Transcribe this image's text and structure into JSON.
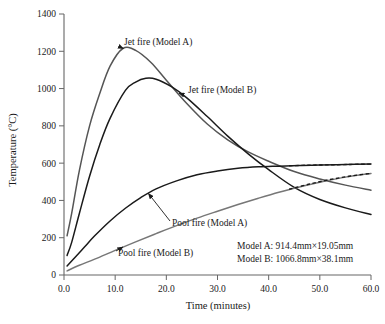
{
  "chart_data": {
    "type": "line",
    "title": "",
    "xlabel": "Time (minutes)",
    "ylabel": "Temperature (°C)",
    "xlim": [
      0,
      60
    ],
    "ylim": [
      0,
      1400
    ],
    "xticks": [
      "0.0",
      "10.0",
      "20.0",
      "30.0",
      "40.0",
      "50.0",
      "60.0"
    ],
    "yticks": [
      "0",
      "200",
      "400",
      "600",
      "800",
      "1000",
      "1200",
      "1400"
    ],
    "grid": false,
    "legend_position": "inline-annotations",
    "series": [
      {
        "name": "Jet fire (Model A)",
        "color": "#555555",
        "style": "solid",
        "x": [
          0.6,
          1.5,
          3,
          5,
          7,
          9,
          11.5,
          14,
          17,
          20,
          24,
          28,
          32,
          36,
          40,
          45,
          50,
          55,
          60
        ],
        "values": [
          210,
          330,
          560,
          800,
          975,
          1120,
          1215,
          1205,
          1140,
          1045,
          920,
          810,
          725,
          660,
          610,
          555,
          515,
          482,
          455
        ]
      },
      {
        "name": "Jet fire (Model B)",
        "color": "#1a1a1a",
        "style": "solid",
        "x": [
          0.6,
          1.5,
          3,
          5,
          7,
          9,
          12,
          14,
          16,
          18,
          21,
          24,
          28,
          32,
          36,
          40,
          45,
          50,
          55,
          60
        ],
        "values": [
          105,
          175,
          330,
          530,
          700,
          840,
          990,
          1035,
          1055,
          1050,
          1010,
          950,
          850,
          745,
          650,
          565,
          470,
          405,
          360,
          325
        ]
      },
      {
        "name": "Pool fire (Model A)",
        "color": "#1a1a1a",
        "style": "solid",
        "x": [
          0.6,
          2,
          4,
          6,
          9,
          12,
          15,
          18,
          22,
          26,
          30,
          34,
          38,
          42,
          46,
          50,
          55,
          60
        ],
        "values": [
          48,
          90,
          150,
          210,
          290,
          358,
          415,
          462,
          505,
          538,
          558,
          572,
          580,
          584,
          588,
          590,
          593,
          595
        ]
      },
      {
        "name": "Pool fire (Model B)",
        "color": "#777777",
        "style": "solid",
        "x": [
          0.6,
          3,
          6,
          10,
          14,
          18,
          22,
          26,
          30,
          34,
          38,
          42,
          46,
          50,
          55,
          60
        ],
        "values": [
          22,
          52,
          85,
          132,
          178,
          222,
          265,
          305,
          342,
          378,
          412,
          444,
          472,
          498,
          525,
          545
        ]
      }
    ],
    "dashed_extensions": [
      {
        "name": "Pool fire (Model A) extrapolation",
        "color": "#1a1a1a",
        "style": "dashed",
        "x": [
          44,
          48,
          52,
          56,
          60
        ],
        "values": [
          586,
          589,
          591,
          593,
          595
        ]
      },
      {
        "name": "Pool fire (Model B) extrapolation",
        "color": "#1a1a1a",
        "style": "dashed",
        "x": [
          44,
          48,
          52,
          56,
          60
        ],
        "values": [
          460,
          488,
          512,
          531,
          545
        ]
      }
    ],
    "annotations": [
      {
        "id": "jet-a",
        "text": "Jet fire (Model A)",
        "tip_x": 11.6,
        "tip_y": 1215
      },
      {
        "id": "jet-b",
        "text": "Jet fire (Model B)",
        "tip_x": 22.5,
        "tip_y": 975
      },
      {
        "id": "pool-a",
        "text": "Pool fire (Model A)",
        "tip_x": 16.5,
        "tip_y": 437
      },
      {
        "id": "pool-b",
        "text": "Pool fire (Model B)",
        "tip_x": 11.5,
        "tip_y": 150
      }
    ],
    "notes": [
      "Model A: 914.4mm×19.05mm",
      "Model B: 1066.8mm×38.1mm"
    ]
  },
  "labels": {
    "xlabel": "Time (minutes)",
    "ylabel": "Temperature (°C)",
    "xticks": [
      "0.0",
      "10.0",
      "20.0",
      "30.0",
      "40.0",
      "50.0",
      "60.0"
    ],
    "yticks": [
      "0",
      "200",
      "400",
      "600",
      "800",
      "1000",
      "1200",
      "1400"
    ],
    "annotation_jet_a": "Jet fire (Model A)",
    "annotation_jet_b": "Jet fire (Model B)",
    "annotation_pool_a": "Pool fire (Model A)",
    "annotation_pool_b": "Pool fire (Model B)",
    "note_model_a": "Model A: 914.4mm×19.05mm",
    "note_model_b": "Model B: 1066.8mm×38.1mm"
  }
}
